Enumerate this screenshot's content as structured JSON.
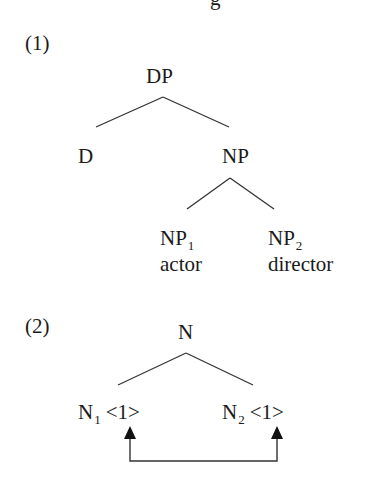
{
  "clipped_top_fragment": "g",
  "example1": {
    "number": "(1)",
    "root": "DP",
    "left_child": "D",
    "right_child": "NP",
    "np_children": [
      {
        "label": "NP",
        "subscript": "1",
        "word": "actor"
      },
      {
        "label": "NP",
        "subscript": "2",
        "word": "director"
      }
    ]
  },
  "example2": {
    "number": "(2)",
    "root": "N",
    "children": [
      {
        "label": "N",
        "subscript": "1",
        "feature": "<1>"
      },
      {
        "label": "N",
        "subscript": "2",
        "feature": "<1>"
      }
    ],
    "arrow": "bidirectional feature link between N1 and N2"
  },
  "colors": {
    "ink": "#1a1a1a",
    "background": "#ffffff"
  }
}
